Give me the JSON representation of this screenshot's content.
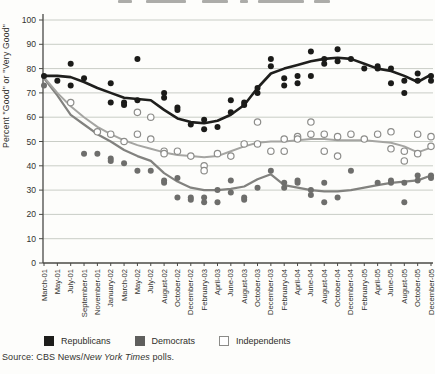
{
  "chart_data": {
    "type": "scatter",
    "ylabel": "Percent \"Good\" or \"Very Good\"",
    "ylim": [
      0,
      100
    ],
    "ytick_interval": 10,
    "grid": true,
    "legend_position": "bottom",
    "categories": [
      "March-01",
      "May-01",
      "July-01",
      "September-01",
      "November-01",
      "January-02",
      "March-02",
      "May-02",
      "July-02",
      "August-02",
      "October-02",
      "December-02",
      "February-03",
      "April-03",
      "June-03",
      "August-03",
      "October-03",
      "December-03",
      "February-04",
      "April-04",
      "June-04",
      "August-04",
      "October-04",
      "December-04",
      "February-05",
      "April-05",
      "June-05",
      "August-05",
      "October-05",
      "December-05"
    ],
    "series": [
      {
        "name": "Republicans",
        "marker": "filled-circle",
        "point_color": "#1b1b19",
        "line_color": "#1f1f1d",
        "line_width": 2.6,
        "points": [
          [
            0,
            77
          ],
          [
            1,
            75
          ],
          [
            2,
            82
          ],
          [
            2,
            73
          ],
          [
            3,
            76
          ],
          [
            5,
            74
          ],
          [
            5,
            66
          ],
          [
            6,
            66
          ],
          [
            6,
            65
          ],
          [
            7,
            84
          ],
          [
            7,
            67
          ],
          [
            9,
            68
          ],
          [
            9,
            70
          ],
          [
            10,
            64
          ],
          [
            10,
            63
          ],
          [
            11,
            57
          ],
          [
            12,
            55
          ],
          [
            12,
            59
          ],
          [
            13,
            56
          ],
          [
            14,
            62
          ],
          [
            14,
            67
          ],
          [
            15,
            66
          ],
          [
            15,
            65
          ],
          [
            16,
            72
          ],
          [
            16,
            70
          ],
          [
            17,
            84
          ],
          [
            17,
            81
          ],
          [
            18,
            76
          ],
          [
            18,
            73
          ],
          [
            19,
            77
          ],
          [
            19,
            74
          ],
          [
            20,
            87
          ],
          [
            20,
            77
          ],
          [
            21,
            84
          ],
          [
            21,
            82
          ],
          [
            22,
            88
          ],
          [
            22,
            83
          ],
          [
            23,
            84
          ],
          [
            24,
            80
          ],
          [
            25,
            81
          ],
          [
            25,
            80
          ],
          [
            26,
            80
          ],
          [
            26,
            74
          ],
          [
            27,
            75
          ],
          [
            27,
            70
          ],
          [
            28,
            78
          ],
          [
            28,
            75
          ],
          [
            29,
            77
          ],
          [
            29,
            75
          ]
        ],
        "trend": [
          [
            0,
            77
          ],
          [
            1,
            77
          ],
          [
            2,
            76.5
          ],
          [
            3,
            74.5
          ],
          [
            4,
            72
          ],
          [
            5,
            70
          ],
          [
            6,
            68
          ],
          [
            7,
            67.5
          ],
          [
            8,
            67
          ],
          [
            9,
            63
          ],
          [
            10,
            59.5
          ],
          [
            11,
            58
          ],
          [
            12,
            57.5
          ],
          [
            13,
            58.5
          ],
          [
            14,
            61
          ],
          [
            15,
            65
          ],
          [
            16,
            72
          ],
          [
            17,
            78
          ],
          [
            18,
            80
          ],
          [
            19,
            81.5
          ],
          [
            20,
            83
          ],
          [
            21,
            84
          ],
          [
            22,
            84.5
          ],
          [
            23,
            84
          ],
          [
            24,
            82
          ],
          [
            25,
            80
          ],
          [
            26,
            79
          ],
          [
            27,
            77
          ],
          [
            28,
            74.5
          ],
          [
            29,
            77.5
          ]
        ]
      },
      {
        "name": "Democrats",
        "marker": "filled-circle",
        "point_color": "#6e6e6c",
        "line_color": "#82827f",
        "line_width": 2.2,
        "points": [
          [
            0,
            73
          ],
          [
            3,
            45
          ],
          [
            4,
            45
          ],
          [
            5,
            43
          ],
          [
            5,
            42
          ],
          [
            6,
            41
          ],
          [
            7,
            38
          ],
          [
            8,
            38
          ],
          [
            9,
            34
          ],
          [
            9,
            33
          ],
          [
            10,
            35
          ],
          [
            10,
            27
          ],
          [
            11,
            27
          ],
          [
            11,
            26
          ],
          [
            12,
            27
          ],
          [
            12,
            25
          ],
          [
            13,
            30
          ],
          [
            13,
            25
          ],
          [
            14,
            34
          ],
          [
            14,
            29
          ],
          [
            15,
            27
          ],
          [
            15,
            26
          ],
          [
            16,
            31
          ],
          [
            17,
            38
          ],
          [
            18,
            33
          ],
          [
            18,
            31
          ],
          [
            19,
            34
          ],
          [
            19,
            33
          ],
          [
            20,
            30
          ],
          [
            20,
            28
          ],
          [
            21,
            33
          ],
          [
            21,
            25
          ],
          [
            22,
            27
          ],
          [
            23,
            38
          ],
          [
            25,
            33
          ],
          [
            26,
            34
          ],
          [
            26,
            33
          ],
          [
            27,
            33
          ],
          [
            27,
            25
          ],
          [
            28,
            36
          ],
          [
            28,
            34
          ],
          [
            29,
            36
          ],
          [
            29,
            35
          ]
        ],
        "trend": [
          [
            0,
            76
          ],
          [
            1,
            69
          ],
          [
            2,
            61
          ],
          [
            3,
            57
          ],
          [
            4,
            53
          ],
          [
            5,
            50
          ],
          [
            6,
            46.5
          ],
          [
            7,
            44
          ],
          [
            8,
            42
          ],
          [
            9,
            37
          ],
          [
            10,
            33.5
          ],
          [
            11,
            31
          ],
          [
            12,
            30
          ],
          [
            13,
            30
          ],
          [
            14,
            30.5
          ],
          [
            15,
            31.5
          ],
          [
            16,
            34.5
          ],
          [
            17,
            36.5
          ],
          [
            18,
            32
          ],
          [
            19,
            31
          ],
          [
            20,
            30
          ],
          [
            21,
            29.5
          ],
          [
            22,
            29.5
          ],
          [
            23,
            30
          ],
          [
            24,
            31
          ],
          [
            25,
            32
          ],
          [
            26,
            33
          ],
          [
            27,
            33.5
          ],
          [
            28,
            34
          ],
          [
            29,
            36
          ]
        ]
      },
      {
        "name": "Independents",
        "marker": "open-circle",
        "point_color": "#ffffff",
        "point_stroke": "#8d8d8a",
        "line_color": "#a5a5a2",
        "line_width": 2.0,
        "points": [
          [
            2,
            66
          ],
          [
            4,
            54
          ],
          [
            5,
            53
          ],
          [
            6,
            50
          ],
          [
            7,
            62
          ],
          [
            7,
            53
          ],
          [
            8,
            60
          ],
          [
            8,
            51
          ],
          [
            9,
            46
          ],
          [
            9,
            45
          ],
          [
            10,
            46
          ],
          [
            11,
            44
          ],
          [
            12,
            40
          ],
          [
            12,
            38
          ],
          [
            13,
            45
          ],
          [
            14,
            44
          ],
          [
            15,
            49
          ],
          [
            16,
            49
          ],
          [
            16,
            58
          ],
          [
            17,
            46
          ],
          [
            18,
            51
          ],
          [
            18,
            46
          ],
          [
            19,
            52
          ],
          [
            19,
            51
          ],
          [
            20,
            58
          ],
          [
            20,
            53
          ],
          [
            21,
            53
          ],
          [
            21,
            46
          ],
          [
            22,
            52
          ],
          [
            22,
            44
          ],
          [
            23,
            53
          ],
          [
            24,
            51
          ],
          [
            25,
            53
          ],
          [
            26,
            54
          ],
          [
            26,
            47
          ],
          [
            27,
            42
          ],
          [
            27,
            46
          ],
          [
            28,
            53
          ],
          [
            28,
            45
          ],
          [
            29,
            52
          ],
          [
            29,
            48
          ]
        ],
        "trend": [
          [
            0,
            76.5
          ],
          [
            1,
            70
          ],
          [
            2,
            64.5
          ],
          [
            3,
            60
          ],
          [
            4,
            56
          ],
          [
            5,
            53
          ],
          [
            6,
            50.5
          ],
          [
            7,
            48.5
          ],
          [
            8,
            47
          ],
          [
            9,
            45.5
          ],
          [
            10,
            44.5
          ],
          [
            11,
            44
          ],
          [
            12,
            43.5
          ],
          [
            13,
            44
          ],
          [
            14,
            46
          ],
          [
            15,
            48
          ],
          [
            16,
            49.5
          ],
          [
            17,
            50
          ],
          [
            18,
            50
          ],
          [
            19,
            50.5
          ],
          [
            20,
            51
          ],
          [
            21,
            51
          ],
          [
            22,
            50.5
          ],
          [
            23,
            50.5
          ],
          [
            24,
            50.5
          ],
          [
            25,
            50
          ],
          [
            26,
            49.5
          ],
          [
            27,
            48
          ],
          [
            28,
            45.5
          ],
          [
            29,
            47.5
          ]
        ]
      }
    ]
  },
  "legend": {
    "items": [
      {
        "label": "Republicans"
      },
      {
        "label": "Democrats"
      },
      {
        "label": "Independents"
      }
    ]
  },
  "source": {
    "prefix": "Source: CBS News/",
    "italic": "New York Times",
    "suffix": " polls."
  },
  "colors": {
    "grid": "#c9cdc6",
    "axis": "#4a4a46",
    "tick_text": "#33332f"
  }
}
